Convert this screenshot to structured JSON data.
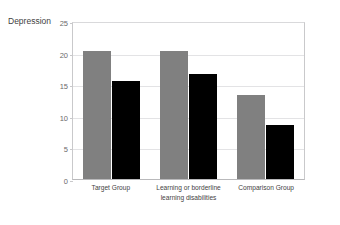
{
  "top_sliver_text": "",
  "chart_data": {
    "type": "bar",
    "title": "",
    "xlabel": "",
    "ylabel": "Depression",
    "ylim": [
      0,
      25
    ],
    "yticks": [
      0,
      5,
      10,
      15,
      20,
      25
    ],
    "grid": true,
    "legend": "none",
    "categories": [
      "Target Group",
      "Learning or borderline learning disabilities",
      "Comparison Group"
    ],
    "category_lines": [
      [
        "Target Group"
      ],
      [
        "Learning or borderline",
        "learning disabilities"
      ],
      [
        "Comparison Group"
      ]
    ],
    "series": [
      {
        "name": "series-1",
        "color": "#808080",
        "values": [
          20.3,
          20.3,
          13.3
        ]
      },
      {
        "name": "series-2",
        "color": "#000000",
        "values": [
          15.5,
          16.6,
          8.6
        ]
      }
    ]
  }
}
